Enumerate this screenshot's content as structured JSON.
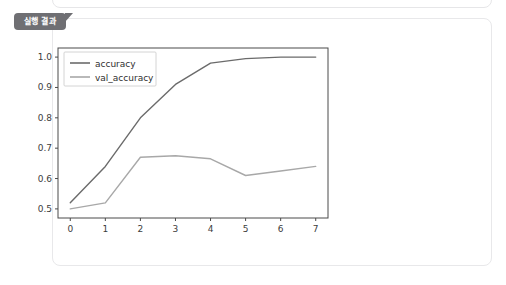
{
  "panels": {
    "top_panel_name": "output-panel-previous",
    "main_panel_name": "execution-result-panel"
  },
  "tab": {
    "label": "실행 결과"
  },
  "colors": {
    "tab_background": "#6f6f73",
    "tab_text": "#ffffff",
    "panel_background": "#ffffff",
    "panel_border": "#e8e8ea",
    "accuracy_line": "#6b6b6b",
    "val_accuracy_line": "#a8a8a8",
    "axis": "#3c3c3c"
  },
  "chart_data": {
    "type": "line",
    "title": "",
    "xlabel": "",
    "ylabel": "",
    "x": [
      0,
      1,
      2,
      3,
      4,
      5,
      6,
      7
    ],
    "xticks": [
      "0",
      "1",
      "2",
      "3",
      "4",
      "5",
      "6",
      "7"
    ],
    "yticks": [
      "0.5",
      "0.6",
      "0.7",
      "0.8",
      "0.9",
      "1.0"
    ],
    "xlim": [
      -0.35,
      7.35
    ],
    "ylim": [
      0.47,
      1.03
    ],
    "grid": false,
    "legend_position": "upper left",
    "series": [
      {
        "name": "accuracy",
        "color": "#6b6b6b",
        "values": [
          0.52,
          0.64,
          0.8,
          0.91,
          0.98,
          0.995,
          1.0,
          1.0
        ]
      },
      {
        "name": "val_accuracy",
        "color": "#a8a8a8",
        "values": [
          0.5,
          0.52,
          0.67,
          0.675,
          0.665,
          0.61,
          0.625,
          0.64
        ]
      }
    ]
  }
}
